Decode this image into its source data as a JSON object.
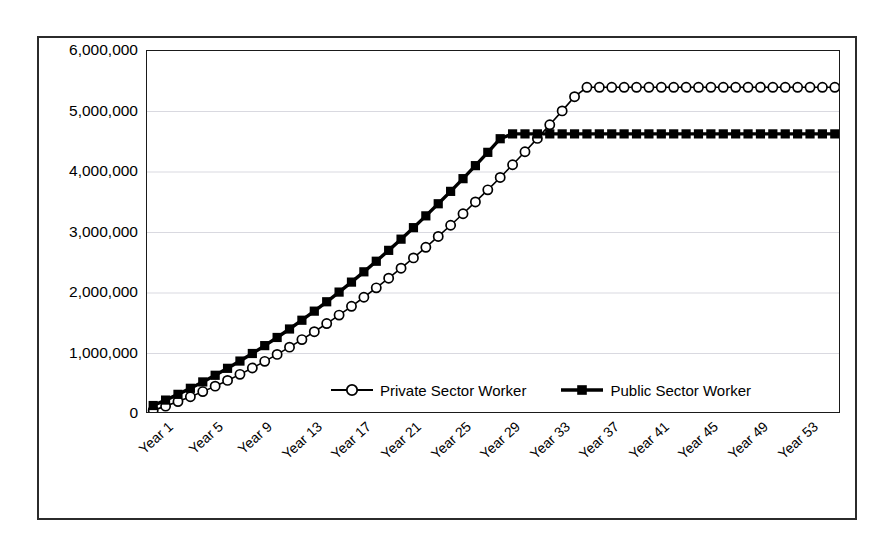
{
  "chart_data": {
    "type": "line",
    "title": "",
    "xlabel": "",
    "ylabel": "",
    "ylim": [
      0,
      6000000
    ],
    "ytick_labels": [
      "6,000,000",
      "5,000,000",
      "4,000,000",
      "3,000,000",
      "2,000,000",
      "1,000,000",
      "0"
    ],
    "ytick_values": [
      6000000,
      5000000,
      4000000,
      3000000,
      2000000,
      1000000,
      0
    ],
    "grid": "horizontal-faint",
    "legend_position": "inside-bottom-center",
    "categories": [
      "Year 1",
      "Year 2",
      "Year 3",
      "Year 4",
      "Year 5",
      "Year 6",
      "Year 7",
      "Year 8",
      "Year 9",
      "Year 10",
      "Year 11",
      "Year 12",
      "Year 13",
      "Year 14",
      "Year 15",
      "Year 16",
      "Year 17",
      "Year 18",
      "Year 19",
      "Year 20",
      "Year 21",
      "Year 22",
      "Year 23",
      "Year 24",
      "Year 25",
      "Year 26",
      "Year 27",
      "Year 28",
      "Year 29",
      "Year 30",
      "Year 31",
      "Year 32",
      "Year 33",
      "Year 34",
      "Year 35",
      "Year 36",
      "Year 37",
      "Year 38",
      "Year 39",
      "Year 40",
      "Year 41",
      "Year 42",
      "Year 43",
      "Year 44",
      "Year 45",
      "Year 46",
      "Year 47",
      "Year 48",
      "Year 49",
      "Year 50",
      "Year 51",
      "Year 52",
      "Year 53",
      "Year 54",
      "Year 55",
      "Year 56"
    ],
    "xtick_labels": [
      "Year 1",
      "Year 5",
      "Year 9",
      "Year 13",
      "Year 17",
      "Year 21",
      "Year 25",
      "Year 29",
      "Year 33",
      "Year 37",
      "Year 41",
      "Year 45",
      "Year 49",
      "Year 53"
    ],
    "xtick_indices": [
      0,
      4,
      8,
      12,
      16,
      20,
      24,
      28,
      32,
      36,
      40,
      44,
      48,
      52
    ],
    "series": [
      {
        "name": "Private Sector Worker",
        "marker": "open-circle",
        "values": [
          60000,
          130000,
          205000,
          285000,
          370000,
          460000,
          555000,
          655000,
          760000,
          870000,
          985000,
          1105000,
          1230000,
          1360000,
          1495000,
          1635000,
          1780000,
          1930000,
          2085000,
          2245000,
          2410000,
          2580000,
          2755000,
          2935000,
          3120000,
          3310000,
          3505000,
          3705000,
          3910000,
          4120000,
          4335000,
          4555000,
          4780000,
          5010000,
          5245000,
          5400000,
          5400000,
          5400000,
          5400000,
          5400000,
          5400000,
          5400000,
          5400000,
          5400000,
          5400000,
          5400000,
          5400000,
          5400000,
          5400000,
          5400000,
          5400000,
          5400000,
          5400000,
          5400000,
          5400000,
          5400000
        ]
      },
      {
        "name": "Public Sector Worker",
        "marker": "filled-square",
        "values": [
          140000,
          230000,
          325000,
          425000,
          530000,
          640000,
          755000,
          875000,
          1000000,
          1130000,
          1265000,
          1405000,
          1550000,
          1700000,
          1855000,
          2015000,
          2180000,
          2350000,
          2525000,
          2705000,
          2890000,
          3080000,
          3275000,
          3475000,
          3680000,
          3890000,
          4105000,
          4325000,
          4550000,
          4630000,
          4630000,
          4630000,
          4630000,
          4630000,
          4630000,
          4630000,
          4630000,
          4630000,
          4630000,
          4630000,
          4630000,
          4630000,
          4630000,
          4630000,
          4630000,
          4630000,
          4630000,
          4630000,
          4630000,
          4630000,
          4630000,
          4630000,
          4630000,
          4630000,
          4630000,
          4630000
        ]
      }
    ]
  },
  "legend": {
    "entries": [
      {
        "label": "Private Sector Worker",
        "marker": "open-circle"
      },
      {
        "label": "Public Sector Worker",
        "marker": "filled-square"
      }
    ]
  },
  "colors": {
    "line": "#000000",
    "frame": "#2b2b2b",
    "plot_border": "#1a1a1a",
    "grid": "#d9d9e0",
    "background": "#ffffff"
  }
}
